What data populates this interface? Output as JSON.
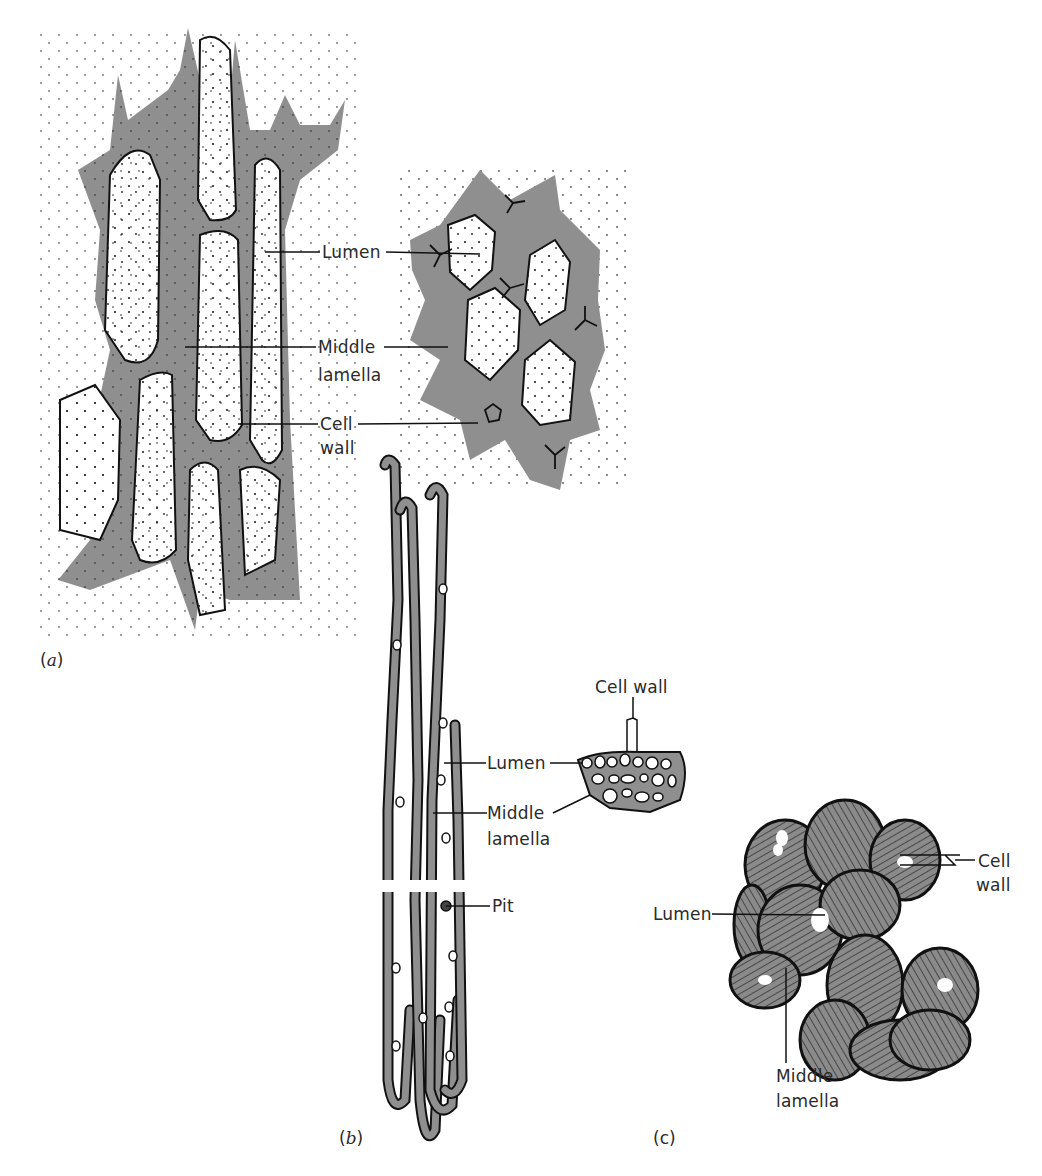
{
  "figure": {
    "colors": {
      "wall_fill": "#8f8f8f",
      "outline": "#111111",
      "background": "#ffffff"
    },
    "panels": [
      {
        "id": "a",
        "label_letter": "a",
        "label": "(a)",
        "labels": {
          "lumen": "Lumen",
          "middle_lamella_1": "Middle",
          "middle_lamella_2": "lamella",
          "cell_wall_1": "Cell",
          "cell_wall_2": "wall"
        }
      },
      {
        "id": "b",
        "label_letter": "b",
        "label": "(b)",
        "labels": {
          "lumen": "Lumen",
          "middle_lamella_1": "Middle",
          "middle_lamella_2": "lamella",
          "pit": "Pit",
          "cell_wall": "Cell wall"
        }
      },
      {
        "id": "c",
        "label_letter": "c",
        "label": "(c)",
        "labels": {
          "cell_wall_1": "Cell",
          "cell_wall_2": "wall",
          "lumen": "Lumen",
          "middle_lamella_1": "Middle",
          "middle_lamella_2": "lamella"
        }
      }
    ]
  }
}
